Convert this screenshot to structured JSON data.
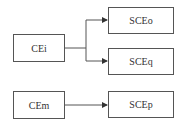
{
  "nodes": {
    "cei": {
      "label": "CEi"
    },
    "sceo": {
      "label": "SCEo"
    },
    "sceq": {
      "label": "SCEq"
    },
    "cem": {
      "label": "CEm"
    },
    "scep": {
      "label": "SCEp"
    }
  },
  "edges": [
    {
      "from": "CEi",
      "to": "SCEo"
    },
    {
      "from": "CEi",
      "to": "SCEq"
    },
    {
      "from": "CEm",
      "to": "SCEp"
    }
  ],
  "colors": {
    "stroke": "#555555",
    "text": "#333333",
    "background": "#ffffff"
  }
}
